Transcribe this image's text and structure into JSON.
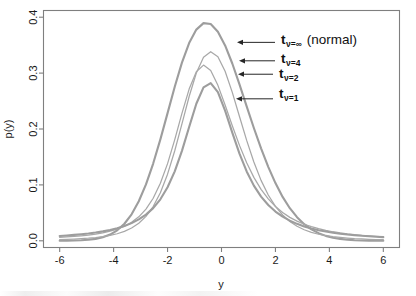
{
  "chart_data": {
    "type": "line",
    "title": "",
    "xlabel": "y",
    "ylabel": "p(y)",
    "xlim": [
      -6.6,
      6.6
    ],
    "ylim": [
      -0.012,
      0.412
    ],
    "xticks": [
      "-6",
      "-4",
      "-2",
      "0",
      "2",
      "4",
      "6"
    ],
    "xtick_values": [
      -6,
      -4,
      -2,
      0,
      2,
      4,
      6
    ],
    "yticks": [
      "0.0",
      "0.1",
      "0.2",
      "0.3",
      "0.4"
    ],
    "ytick_values": [
      0.0,
      0.1,
      0.2,
      0.3,
      0.4
    ],
    "grid": false,
    "legend_position": "inline-annotations",
    "line_color": "#9d9d9d",
    "series": [
      {
        "name": "t_nu=inf (normal)",
        "label_base": "t",
        "label_sub": "ν=∞",
        "label_note": "(normal)",
        "df": "inf",
        "peak_value": 0.399,
        "values": [
          0.0001,
          0.0002,
          0.0004,
          0.0009,
          0.0018,
          0.0034,
          0.0063,
          0.0111,
          0.0188,
          0.0305,
          0.0474,
          0.0707,
          0.1009,
          0.1382,
          0.1815,
          0.2284,
          0.2756,
          0.3187,
          0.3538,
          0.3778,
          0.3894,
          0.3878,
          0.3739,
          0.3495,
          0.3172,
          0.2799,
          0.2406,
          0.2018,
          0.1654,
          0.1323,
          0.1032,
          0.0785,
          0.0583,
          0.0422,
          0.0297,
          0.0204,
          0.0136,
          0.0088,
          0.0056,
          0.0034,
          0.002,
          0.0011,
          0.0006,
          0.0003,
          0.0002,
          0.0001
        ]
      },
      {
        "name": "t_nu=4",
        "label_base": "t",
        "label_sub": "ν=4",
        "df": 4,
        "peak_value": 0.375,
        "values": [
          0.0021,
          0.0025,
          0.003,
          0.0037,
          0.0046,
          0.0058,
          0.0074,
          0.0096,
          0.0126,
          0.0168,
          0.0228,
          0.0314,
          0.0437,
          0.0613,
          0.086,
          0.1192,
          0.1611,
          0.2093,
          0.2581,
          0.3001,
          0.3282,
          0.3384,
          0.3293,
          0.3032,
          0.2655,
          0.2224,
          0.1796,
          0.1409,
          0.1081,
          0.0819,
          0.0615,
          0.0461,
          0.0345,
          0.026,
          0.0197,
          0.0151,
          0.0117,
          0.0092,
          0.0073,
          0.0059,
          0.0048,
          0.0039,
          0.0033,
          0.0027,
          0.0023,
          0.002
        ]
      },
      {
        "name": "t_nu=2",
        "label_base": "t",
        "label_sub": "ν=2",
        "df": 2,
        "peak_value": 0.354,
        "values": [
          0.006,
          0.0068,
          0.0077,
          0.0089,
          0.0103,
          0.0121,
          0.0143,
          0.0172,
          0.021,
          0.0261,
          0.0331,
          0.0429,
          0.0567,
          0.0761,
          0.1028,
          0.138,
          0.1811,
          0.228,
          0.2714,
          0.3025,
          0.3143,
          0.3045,
          0.2781,
          0.243,
          0.2059,
          0.1707,
          0.1396,
          0.1135,
          0.0921,
          0.0749,
          0.0613,
          0.0505,
          0.0419,
          0.0351,
          0.0296,
          0.0252,
          0.0216,
          0.0186,
          0.0162,
          0.0141,
          0.0124,
          0.011,
          0.0097,
          0.0087,
          0.0078,
          0.007
        ]
      },
      {
        "name": "t_nu=1",
        "label_base": "t",
        "label_sub": "ν=1",
        "df": 1,
        "peak_value": 0.318,
        "values": [
          0.0086,
          0.0095,
          0.0105,
          0.0117,
          0.0131,
          0.0148,
          0.0169,
          0.0194,
          0.0225,
          0.0265,
          0.0316,
          0.0382,
          0.0468,
          0.0584,
          0.0742,
          0.0957,
          0.1243,
          0.1609,
          0.2037,
          0.2452,
          0.2744,
          0.2821,
          0.266,
          0.233,
          0.1935,
          0.1558,
          0.124,
          0.0987,
          0.0791,
          0.064,
          0.0523,
          0.0432,
          0.036,
          0.0303,
          0.0257,
          0.022,
          0.019,
          0.0165,
          0.0144,
          0.0127,
          0.0112,
          0.01,
          0.0089,
          0.008,
          0.0072,
          0.0065
        ]
      }
    ],
    "annotations": [
      {
        "series": "t_nu=inf (normal)",
        "text": "t",
        "sub": "ν=∞",
        "note": "(normal)",
        "arrow_target_y": 0.355
      },
      {
        "series": "t_nu=4",
        "text": "t",
        "sub": "ν=4",
        "note": "",
        "arrow_target_y": 0.322
      },
      {
        "series": "t_nu=2",
        "text": "t",
        "sub": "ν=2",
        "note": "",
        "arrow_target_y": 0.298
      },
      {
        "series": "t_nu=1",
        "text": "t",
        "sub": "ν=1",
        "note": "",
        "arrow_target_y": 0.254
      }
    ]
  }
}
